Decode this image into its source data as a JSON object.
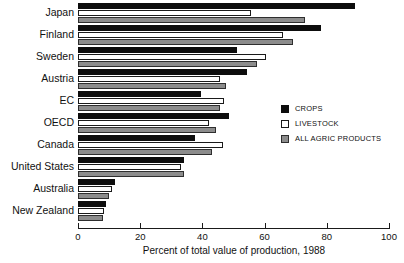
{
  "chart_data": {
    "type": "bar",
    "orientation": "horizontal",
    "title": "",
    "subtitle": "",
    "xlabel": "Percent of total value of production, 1988",
    "ylabel": "",
    "xlim": [
      0,
      100
    ],
    "xticks": [
      0,
      20,
      40,
      60,
      80,
      100
    ],
    "xtick_labels": [
      "0",
      "20",
      "40",
      "60",
      "80",
      "100"
    ],
    "grid": false,
    "legend_position": "middle-right",
    "categories": [
      "Japan",
      "Finland",
      "Sweden",
      "Austria",
      "EC",
      "OECD",
      "Canada",
      "United States",
      "Australia",
      "New Zealand"
    ],
    "series": [
      {
        "name": "CROPS",
        "color": "#0d0d0d",
        "values": [
          89,
          78,
          51,
          54.5,
          39.5,
          48.5,
          37.5,
          34,
          12,
          9
        ]
      },
      {
        "name": "LIVESTOCK",
        "color": "#ffffff",
        "values": [
          55.5,
          66,
          60.5,
          45.5,
          47,
          42,
          46.5,
          33,
          11,
          8.5
        ]
      },
      {
        "name": "ALL AGRIC PRODUCTS",
        "color": "#8c8c8c",
        "values": [
          73,
          69,
          57.5,
          47.5,
          45.5,
          44.5,
          43,
          34,
          10,
          8
        ]
      }
    ]
  },
  "legend": {
    "items": [
      {
        "label": "CROPS",
        "key": "crops"
      },
      {
        "label": "LIVESTOCK",
        "key": "livestock"
      },
      {
        "label": "ALL AGRIC PRODUCTS",
        "key": "allagric"
      }
    ]
  }
}
